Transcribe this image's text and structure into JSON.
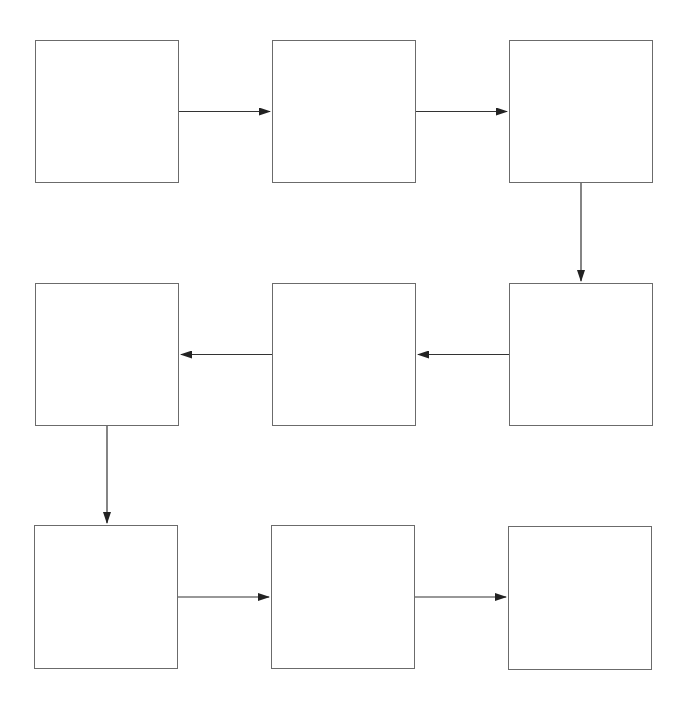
{
  "diagram": {
    "type": "serpentine-flow",
    "style": {
      "box_border_color": "#6b6b6b",
      "arrow_color": "#333333",
      "background": "#ffffff"
    },
    "nodes": [
      {
        "id": "n1",
        "row": 1,
        "col": 1,
        "label": "",
        "x": 35,
        "y": 40,
        "w": 144,
        "h": 143
      },
      {
        "id": "n2",
        "row": 1,
        "col": 2,
        "label": "",
        "x": 272,
        "y": 40,
        "w": 144,
        "h": 143
      },
      {
        "id": "n3",
        "row": 1,
        "col": 3,
        "label": "",
        "x": 509,
        "y": 40,
        "w": 144,
        "h": 143
      },
      {
        "id": "n4",
        "row": 2,
        "col": 3,
        "label": "",
        "x": 509,
        "y": 283,
        "w": 144,
        "h": 143
      },
      {
        "id": "n5",
        "row": 2,
        "col": 2,
        "label": "",
        "x": 272,
        "y": 283,
        "w": 144,
        "h": 143
      },
      {
        "id": "n6",
        "row": 2,
        "col": 1,
        "label": "",
        "x": 35,
        "y": 283,
        "w": 144,
        "h": 143
      },
      {
        "id": "n7",
        "row": 3,
        "col": 1,
        "label": "",
        "x": 34,
        "y": 525,
        "w": 144,
        "h": 144
      },
      {
        "id": "n8",
        "row": 3,
        "col": 2,
        "label": "",
        "x": 271,
        "y": 525,
        "w": 144,
        "h": 144
      },
      {
        "id": "n9",
        "row": 3,
        "col": 3,
        "label": "",
        "x": 508,
        "y": 526,
        "w": 144,
        "h": 144
      }
    ],
    "edges": [
      {
        "from": "n1",
        "to": "n2",
        "direction": "right"
      },
      {
        "from": "n2",
        "to": "n3",
        "direction": "right"
      },
      {
        "from": "n3",
        "to": "n4",
        "direction": "down"
      },
      {
        "from": "n4",
        "to": "n5",
        "direction": "left"
      },
      {
        "from": "n5",
        "to": "n6",
        "direction": "left"
      },
      {
        "from": "n6",
        "to": "n7",
        "direction": "down"
      },
      {
        "from": "n7",
        "to": "n8",
        "direction": "right"
      },
      {
        "from": "n8",
        "to": "n9",
        "direction": "right"
      }
    ]
  }
}
